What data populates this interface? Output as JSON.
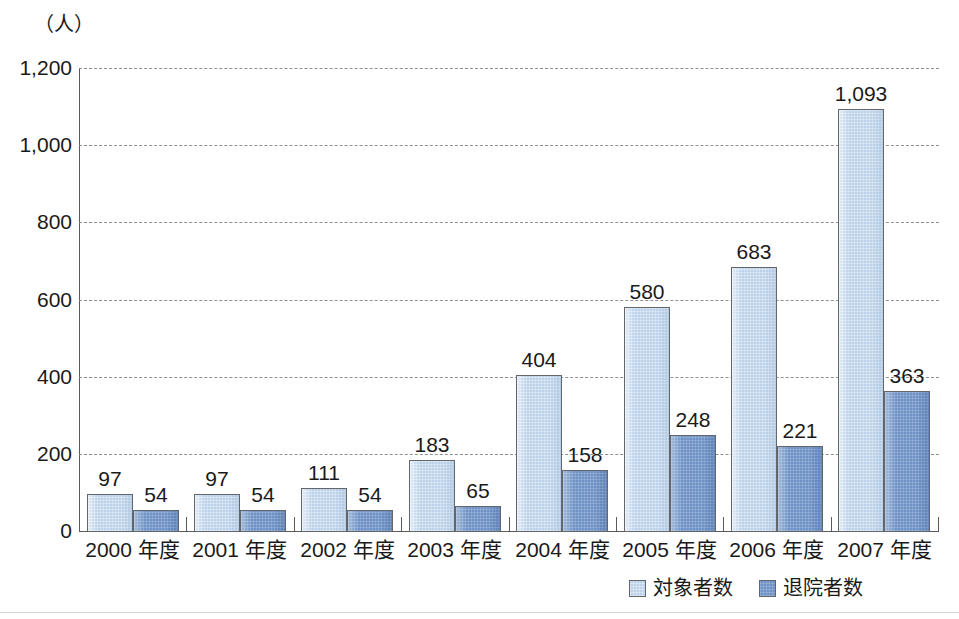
{
  "chart_data": {
    "type": "bar",
    "title": "",
    "subtitle": "",
    "xlabel": "",
    "ylabel": "",
    "unit_caption": "（人）",
    "categories": [
      "2000 年度",
      "2001 年度",
      "2002 年度",
      "2003 年度",
      "2004 年度",
      "2005 年度",
      "2006 年度",
      "2007 年度"
    ],
    "series": [
      {
        "name": "対象者数",
        "color": "#bcd2ea",
        "values": [
          97,
          97,
          111,
          183,
          404,
          580,
          683,
          1093
        ],
        "labels": [
          "97",
          "97",
          "111",
          "183",
          "404",
          "580",
          "683",
          "1,093"
        ]
      },
      {
        "name": "退院者数",
        "color": "#6f93c6",
        "values": [
          54,
          54,
          54,
          65,
          158,
          248,
          221,
          363
        ],
        "labels": [
          "54",
          "54",
          "54",
          "65",
          "158",
          "248",
          "221",
          "363"
        ]
      }
    ],
    "ylim": [
      0,
      1200
    ],
    "yticks": [
      0,
      200,
      400,
      600,
      800,
      1000,
      1200
    ],
    "ytick_labels": [
      "0",
      "200",
      "400",
      "600",
      "800",
      "1,000",
      "1,200"
    ],
    "grid": true,
    "grid_style": "dashed",
    "legend_position": "bottom-right"
  },
  "colors": {
    "series_target": "#bcd2ea",
    "series_discharge": "#6f93c6",
    "axis": "#555a5e",
    "grid": "#8d8f92",
    "bar_border": "#63666a",
    "text": "#1a1a1a"
  }
}
